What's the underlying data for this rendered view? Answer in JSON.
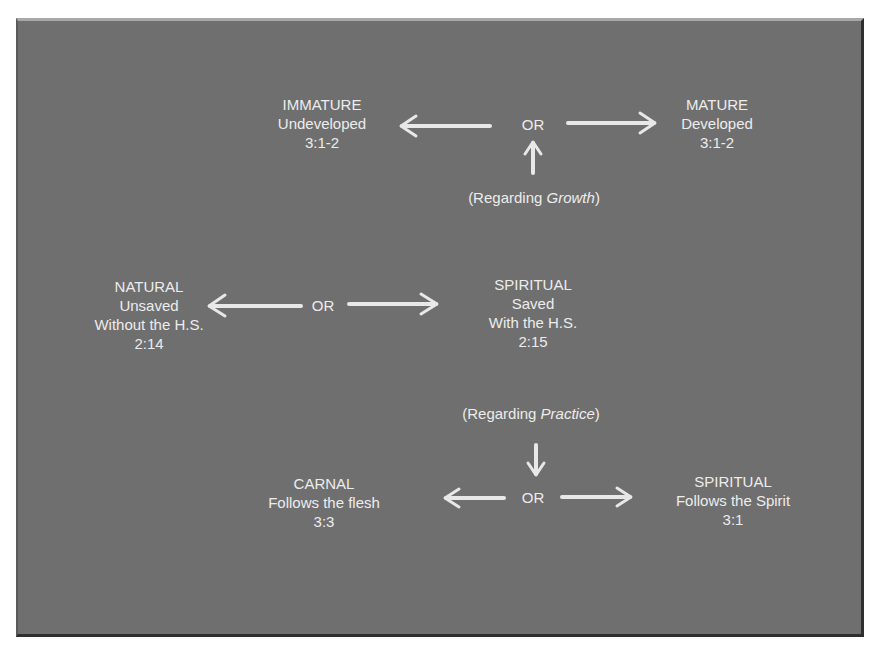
{
  "diagram": {
    "growth_section": {
      "left_node": {
        "title": "IMMATURE",
        "subtitle": "Undeveloped",
        "ref": "3:1-2"
      },
      "connector": "OR",
      "right_node": {
        "title": "MATURE",
        "subtitle": "Developed",
        "ref": "3:1-2"
      },
      "note_prefix": "(Regarding ",
      "note_emphasis": "Growth",
      "note_suffix": ")"
    },
    "salvation_section": {
      "left_node": {
        "title": "NATURAL",
        "subtitle": "Unsaved",
        "detail": "Without the H.S.",
        "ref": "2:14"
      },
      "connector": "OR",
      "right_node": {
        "title": "SPIRITUAL",
        "subtitle": "Saved",
        "detail": "With the H.S.",
        "ref": "2:15"
      }
    },
    "practice_section": {
      "note_prefix": "(Regarding ",
      "note_emphasis": "Practice",
      "note_suffix": ")",
      "left_node": {
        "title": "CARNAL",
        "subtitle": "Follows the flesh",
        "ref": "3:3"
      },
      "connector": "OR",
      "right_node": {
        "title": "SPIRITUAL",
        "subtitle": "Follows the Spirit",
        "ref": "3:1"
      }
    }
  }
}
